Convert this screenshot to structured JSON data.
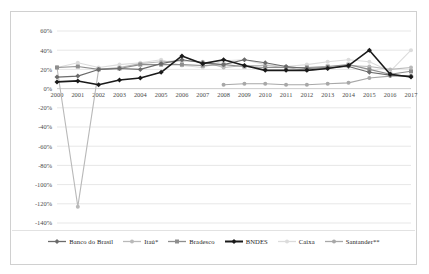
{
  "chart_data": {
    "type": "line",
    "title": "",
    "subtitle": "",
    "xlabel": "",
    "ylabel": "",
    "grid": true,
    "legend_position": "bottom",
    "x": [
      2000,
      2001,
      2002,
      2003,
      2004,
      2005,
      2006,
      2007,
      2008,
      2009,
      2010,
      2011,
      2012,
      2013,
      2014,
      2015,
      2016,
      2017
    ],
    "categories": [
      "2000",
      "2001",
      "2002",
      "2003",
      "2004",
      "2005",
      "2006",
      "2007",
      "2008",
      "2009",
      "2010",
      "2011",
      "2012",
      "2013",
      "2014",
      "2015",
      "2016",
      "2017"
    ],
    "ylim": [
      -140,
      60
    ],
    "yticks": [
      60,
      40,
      20,
      0,
      -20,
      -40,
      -60,
      -80,
      -100,
      -120,
      -140
    ],
    "ytick_labels": [
      "60%",
      "40%",
      "20%",
      "0%",
      "-20%",
      "-40%",
      "-60%",
      "-80%",
      "-100%",
      "-120%",
      "-140%"
    ],
    "series": [
      {
        "name": "Banco do Brasil",
        "color": "#6b6b6b",
        "marker": "diamond",
        "values": [
          12,
          13,
          20,
          21,
          20,
          26,
          30,
          27,
          25,
          30,
          27,
          23,
          21,
          22,
          23,
          17,
          14,
          13
        ]
      },
      {
        "name": "Itaú*",
        "color": "#b9b9b9",
        "marker": "circle",
        "values": [
          22,
          -123,
          20,
          22,
          26,
          28,
          29,
          28,
          22,
          24,
          24,
          22,
          19,
          21,
          24,
          23,
          20,
          22
        ]
      },
      {
        "name": "Bradesco",
        "color": "#8e8e8e",
        "marker": "square",
        "values": [
          22,
          23,
          20,
          21,
          25,
          25,
          25,
          24,
          25,
          23,
          22,
          22,
          22,
          23,
          25,
          20,
          15,
          18
        ]
      },
      {
        "name": "BNDES",
        "color": "#1a1a1a",
        "marker": "diamond",
        "values": [
          7,
          8,
          4,
          9,
          11,
          17,
          34,
          26,
          30,
          24,
          19,
          19,
          19,
          21,
          24,
          40,
          15,
          12
        ]
      },
      {
        "name": "Caixa",
        "color": "#dcdcdc",
        "marker": "circle",
        "values": [
          22,
          27,
          22,
          25,
          27,
          30,
          24,
          22,
          29,
          30,
          25,
          23,
          25,
          28,
          30,
          28,
          18,
          40
        ]
      },
      {
        "name": "Santander**",
        "color": "#a8a8a8",
        "marker": "circle",
        "values": [
          null,
          null,
          null,
          null,
          null,
          null,
          null,
          null,
          4,
          5,
          5,
          4,
          4,
          5,
          6,
          11,
          13,
          13
        ]
      }
    ]
  },
  "legend": {
    "items": [
      {
        "label": "Banco do Brasil"
      },
      {
        "label": "Itaú*"
      },
      {
        "label": "Bradesco"
      },
      {
        "label": "BNDES"
      },
      {
        "label": "Caixa"
      },
      {
        "label": "Santander**"
      }
    ]
  }
}
